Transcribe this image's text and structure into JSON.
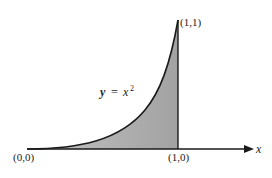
{
  "diagram": {
    "curve_label_y": "y",
    "curve_label_eq": "=",
    "curve_label_x": "x",
    "curve_label_exp": "2",
    "point_origin": "(0,0)",
    "point_top": "(1,1)",
    "point_x1": "(1,0)",
    "axis_label": "x",
    "colors": {
      "fill": "#a8a8a8",
      "line": "#1a1a1a",
      "background": "#ffffff"
    }
  }
}
